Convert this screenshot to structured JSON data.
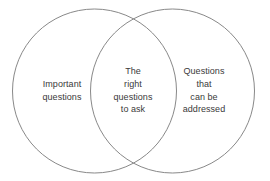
{
  "diagram": {
    "type": "venn",
    "background_color": "#ffffff",
    "stroke_color": "#7a7a7a",
    "text_color": "#3a3a3a",
    "regions": {
      "left_only": {
        "label": "Important\nquestions",
        "lines": [
          "Important",
          "questions"
        ]
      },
      "intersection": {
        "label": "The\nright\nquestions\nto ask",
        "lines": [
          "The",
          "right",
          "questions",
          "to ask"
        ]
      },
      "right_only": {
        "label": "Questions\nthat\ncan be\naddressed",
        "lines": [
          "Questions",
          "that",
          "can be",
          "addressed"
        ]
      }
    },
    "circles": [
      {
        "name": "left-circle",
        "cx": 94.5,
        "cy": 91,
        "r": 82
      },
      {
        "name": "right-circle",
        "cx": 172.5,
        "cy": 91,
        "r": 82
      }
    ]
  }
}
